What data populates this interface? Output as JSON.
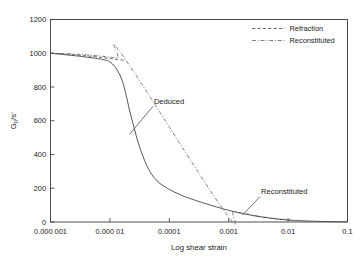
{
  "chart_data": {
    "type": "line",
    "title": "",
    "xlabel": "Log shear strain",
    "ylabel": "G0/s'",
    "ylabel_parts": {
      "main": "G",
      "sub": "0",
      "rest": "/s'"
    },
    "xscale": "log",
    "xlim": [
      1e-06,
      0.1
    ],
    "ylim": [
      0,
      1200
    ],
    "grid": false,
    "xticks": [
      1e-06,
      1e-05,
      0.0001,
      0.001,
      0.01,
      0.1
    ],
    "xtick_labels": [
      "0.000 001",
      "0.000 01",
      "0.0001",
      "0.001",
      "0.01",
      "0.1"
    ],
    "yticks": [
      0,
      200,
      400,
      600,
      800,
      1000,
      1200
    ],
    "ytick_labels": [
      "0",
      "200",
      "400",
      "600",
      "800",
      "1000",
      "1200"
    ],
    "legend_position": "top-right",
    "legend": [
      {
        "label": "Refraction",
        "style": "dashed"
      },
      {
        "label": "Reconstituted",
        "style": "dash-dot"
      }
    ],
    "annotations": [
      {
        "text": "Deduced",
        "label_x": 5.5e-05,
        "label_y": 700,
        "target_x": 2.15e-05,
        "target_y": 520
      },
      {
        "text": "Reconstituted",
        "label_x": 0.0035,
        "label_y": 165,
        "target_x": 0.0017,
        "target_y": 40
      }
    ],
    "series": [
      {
        "name": "Deduced",
        "style": "solid",
        "x": [
          1e-06,
          1.3e-06,
          1.8e-06,
          2.5e-06,
          3.5e-06,
          5e-06,
          6.5e-06,
          8e-06,
          9e-06,
          1e-05,
          1.15e-05,
          1.35e-05,
          1.6e-05,
          1.85e-05,
          2.15e-05,
          2.55e-05,
          3e-05,
          3.55e-05,
          4.25e-05,
          5e-05,
          6e-05,
          7e-05,
          8.5e-05,
          0.0001,
          0.00013,
          0.00017,
          0.00022,
          0.0003,
          0.0004,
          0.00055,
          0.0007,
          0.001,
          0.0014,
          0.002,
          0.003,
          0.0045,
          0.0065,
          0.01,
          0.015,
          0.025,
          0.04,
          0.07,
          0.1
        ],
        "y": [
          1000,
          996,
          991,
          986,
          980,
          973,
          967,
          961,
          956,
          948,
          930,
          895,
          840,
          760,
          660,
          560,
          470,
          395,
          330,
          285,
          250,
          228,
          208,
          193,
          173,
          155,
          140,
          124,
          110,
          95,
          84,
          69,
          57,
          46,
          34,
          25,
          18,
          12,
          8,
          5,
          3,
          1.5,
          1
        ]
      },
      {
        "name": "Refraction",
        "style": "dashed",
        "x": [
          1e-06,
          1.5e-06,
          2.2e-06,
          3e-06,
          4.2e-06,
          5.8e-06,
          8e-06,
          1.1e-05,
          1.45e-05,
          1.75e-05
        ],
        "y": [
          1000,
          997,
          993,
          989,
          984,
          979,
          973,
          967,
          962,
          958
        ]
      },
      {
        "name": "Reconstituted",
        "style": "dash-dot",
        "x": [
          1e-06,
          1.6e-06,
          2.5e-06,
          3.8e-06,
          5.8e-06,
          9e-06,
          1.35e-05,
          1.8e-05,
          0.0008,
          0.0012,
          0.0018,
          0.0026,
          0.0038,
          0.0055,
          0.008,
          0.011
        ],
        "y": [
          1000,
          998,
          995,
          991,
          986,
          979,
          972,
          966,
          76,
          62,
          50,
          40,
          30,
          22,
          15,
          11
        ]
      }
    ]
  }
}
